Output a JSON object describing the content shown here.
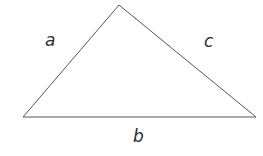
{
  "figure": {
    "name": "triangle-with-labeled-sides",
    "width": 263,
    "height": 156,
    "background_color": "#ffffff"
  },
  "shape": {
    "type": "triangle",
    "stroke_color": "#555555",
    "stroke_width": 1,
    "fill": "none",
    "vertices": {
      "apex": {
        "x": 119,
        "y": 5
      },
      "bottom_left": {
        "x": 23,
        "y": 117
      },
      "bottom_right": {
        "x": 256,
        "y": 117
      }
    },
    "polygon_points": "119,5 256,117 23,117"
  },
  "labels": {
    "left_side": {
      "text": "a",
      "x": 45,
      "y": 32,
      "color": "#2e2e2e",
      "style": "italic"
    },
    "right_side": {
      "text": "c",
      "x": 204,
      "y": 33,
      "color": "#2e2e2e",
      "style": "italic"
    },
    "base_side": {
      "text": "b",
      "x": 133,
      "y": 128,
      "color": "#2e2e2e",
      "style": "italic"
    }
  }
}
